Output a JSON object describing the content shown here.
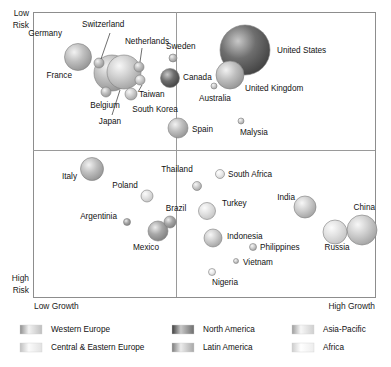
{
  "chart_data": {
    "type": "scatter",
    "title": "",
    "xlabel_left": "Low Growth",
    "xlabel_right": "High Growth",
    "ylabel_top": "Low Risk",
    "ylabel_bottom": "High Risk",
    "grid": false,
    "quadrants": true,
    "note": "Bubble (scatter) chart: horizontal axis = market growth, vertical axis = risk (low at top, high at bottom). Bubble area encodes market size. Colour encodes region.",
    "axis_labels": {
      "low_risk_line1": "Low",
      "low_risk_line2": "Risk",
      "high_risk_line1": "High",
      "high_risk_line2": "Risk",
      "low_growth": "Low Growth",
      "high_growth": "High Growth"
    },
    "points": [
      {
        "label": "Germany",
        "x": 78,
        "y": 57,
        "r": 13.5,
        "region": "western-europe",
        "anchor": "end",
        "lx": 62,
        "ly": 36
      },
      {
        "label": "Switzerland",
        "x": 99,
        "y": 63,
        "r": 5.0,
        "region": "western-europe",
        "anchor": "start",
        "lx": 82,
        "ly": 27,
        "leader": [
          110,
          33,
          101,
          59
        ]
      },
      {
        "label": "France",
        "x": 112,
        "y": 73,
        "r": 18.0,
        "region": "western-europe",
        "anchor": "end",
        "lx": 72,
        "ly": 78
      },
      {
        "label": "Japan",
        "x": 124,
        "y": 72,
        "r": 17.0,
        "region": "asia-pacific",
        "anchor": "middle",
        "lx": 110,
        "ly": 124,
        "leader": [
          112,
          115,
          120,
          90
        ]
      },
      {
        "label": "Netherlands",
        "x": 139,
        "y": 67,
        "r": 5.0,
        "region": "western-europe",
        "anchor": "middle",
        "lx": 147,
        "ly": 44,
        "leader": [
          142,
          48,
          140,
          62
        ]
      },
      {
        "label": "Taiwan",
        "x": 140,
        "y": 80,
        "r": 5.0,
        "region": "asia-pacific",
        "anchor": "start",
        "lx": 139,
        "ly": 97,
        "leader": [
          138,
          92,
          142,
          85
        ]
      },
      {
        "label": "Belgium",
        "x": 106,
        "y": 92,
        "r": 5.0,
        "region": "western-europe",
        "anchor": "middle",
        "lx": 105,
        "ly": 108
      },
      {
        "label": "South Korea",
        "x": 131,
        "y": 94,
        "r": 6.0,
        "region": "asia-pacific",
        "anchor": "middle",
        "lx": 155,
        "ly": 112
      },
      {
        "label": "Sweden",
        "x": 173,
        "y": 58,
        "r": 4.0,
        "region": "western-europe",
        "anchor": "start",
        "lx": 166,
        "ly": 49
      },
      {
        "label": "Canada",
        "x": 170,
        "y": 78,
        "r": 9.5,
        "region": "north-america",
        "anchor": "start",
        "lx": 183,
        "ly": 80
      },
      {
        "label": "United States",
        "x": 245,
        "y": 50,
        "r": 25.0,
        "region": "north-america",
        "anchor": "start",
        "lx": 277,
        "ly": 53
      },
      {
        "label": "United Kingdom",
        "x": 230,
        "y": 75,
        "r": 14.0,
        "region": "western-europe",
        "anchor": "start",
        "lx": 245,
        "ly": 91
      },
      {
        "label": "Australia",
        "x": 214,
        "y": 86,
        "r": 3.0,
        "region": "asia-pacific",
        "anchor": "start",
        "lx": 199,
        "ly": 101
      },
      {
        "label": "Spain",
        "x": 178,
        "y": 128,
        "r": 10.0,
        "region": "western-europe",
        "anchor": "start",
        "lx": 192,
        "ly": 132
      },
      {
        "label": "Malysia",
        "x": 241,
        "y": 121,
        "r": 3.0,
        "region": "asia-pacific",
        "anchor": "start",
        "lx": 240,
        "ly": 135
      },
      {
        "label": "Italy",
        "x": 92,
        "y": 169,
        "r": 11.5,
        "region": "western-europe",
        "anchor": "end",
        "lx": 77,
        "ly": 179
      },
      {
        "label": "Poland",
        "x": 147,
        "y": 196,
        "r": 6.0,
        "region": "central-eastern-europe",
        "anchor": "middle",
        "lx": 125,
        "ly": 188
      },
      {
        "label": "Thailand",
        "x": 197,
        "y": 186,
        "r": 4.5,
        "region": "asia-pacific",
        "anchor": "middle",
        "lx": 177,
        "ly": 172
      },
      {
        "label": "South Africa",
        "x": 220,
        "y": 174,
        "r": 4.5,
        "region": "africa",
        "anchor": "start",
        "lx": 228,
        "ly": 177
      },
      {
        "label": "Argentinia",
        "x": 127,
        "y": 222,
        "r": 3.5,
        "region": "latin-america",
        "anchor": "end",
        "lx": 117,
        "ly": 219
      },
      {
        "label": "Brazil",
        "x": 170,
        "y": 222,
        "r": 6.0,
        "region": "latin-america",
        "anchor": "middle",
        "lx": 176,
        "ly": 211
      },
      {
        "label": "Mexico",
        "x": 158,
        "y": 231,
        "r": 10.0,
        "region": "latin-america",
        "anchor": "middle",
        "lx": 146,
        "ly": 250
      },
      {
        "label": "Turkey",
        "x": 207,
        "y": 211,
        "r": 8.5,
        "region": "central-eastern-europe",
        "anchor": "start",
        "lx": 222,
        "ly": 206
      },
      {
        "label": "Indonesia",
        "x": 213,
        "y": 238,
        "r": 9.0,
        "region": "asia-pacific",
        "anchor": "start",
        "lx": 227,
        "ly": 239
      },
      {
        "label": "Philippines",
        "x": 253,
        "y": 247,
        "r": 3.5,
        "region": "asia-pacific",
        "anchor": "start",
        "lx": 260,
        "ly": 250
      },
      {
        "label": "Vietnam",
        "x": 236,
        "y": 261,
        "r": 2.5,
        "region": "asia-pacific",
        "anchor": "start",
        "lx": 243,
        "ly": 265
      },
      {
        "label": "Nigeria",
        "x": 212,
        "y": 272,
        "r": 3.5,
        "region": "africa",
        "anchor": "start",
        "lx": 212,
        "ly": 285
      },
      {
        "label": "India",
        "x": 305,
        "y": 207,
        "r": 11.0,
        "region": "asia-pacific",
        "anchor": "end",
        "lx": 295,
        "ly": 200
      },
      {
        "label": "Russia",
        "x": 335,
        "y": 232,
        "r": 12.0,
        "region": "central-eastern-europe",
        "anchor": "middle",
        "lx": 337,
        "ly": 250
      },
      {
        "label": "China",
        "x": 362,
        "y": 230,
        "r": 15.0,
        "region": "asia-pacific",
        "anchor": "end",
        "lx": 375,
        "ly": 210
      }
    ],
    "regions": {
      "western-europe": {
        "base": "#bfbfbf",
        "highlight": "#f2f2f2",
        "shade": "#8e8e8e"
      },
      "central-eastern-europe": {
        "base": "#e2e2e2",
        "highlight": "#fbfbfb",
        "shade": "#c0c0c0"
      },
      "north-america": {
        "base": "#6e6e6e",
        "highlight": "#c8c8c8",
        "shade": "#3c3c3c"
      },
      "latin-america": {
        "base": "#a8a8a8",
        "highlight": "#ececec",
        "shade": "#7a7a7a"
      },
      "asia-pacific": {
        "base": "#cfcfcf",
        "highlight": "#f7f7f7",
        "shade": "#9c9c9c"
      },
      "africa": {
        "base": "#ededed",
        "highlight": "#ffffff",
        "shade": "#cccccc"
      }
    }
  },
  "legend": {
    "position": "bottom",
    "items": [
      {
        "label": "Western Europe",
        "region": "western-europe",
        "col": 0,
        "row": 0
      },
      {
        "label": "Central & Eastern Europe",
        "region": "central-eastern-europe",
        "col": 0,
        "row": 1
      },
      {
        "label": "North America",
        "region": "north-america",
        "col": 1,
        "row": 0
      },
      {
        "label": "Latin America",
        "region": "latin-america",
        "col": 1,
        "row": 1
      },
      {
        "label": "Asia-Pacific",
        "region": "asia-pacific",
        "col": 2,
        "row": 0
      },
      {
        "label": "Africa",
        "region": "africa",
        "col": 2,
        "row": 1
      }
    ]
  },
  "frame": {
    "left": 33,
    "top": 12,
    "right": 375,
    "bottom": 297,
    "divider_x": 176,
    "divider_y": 150
  }
}
